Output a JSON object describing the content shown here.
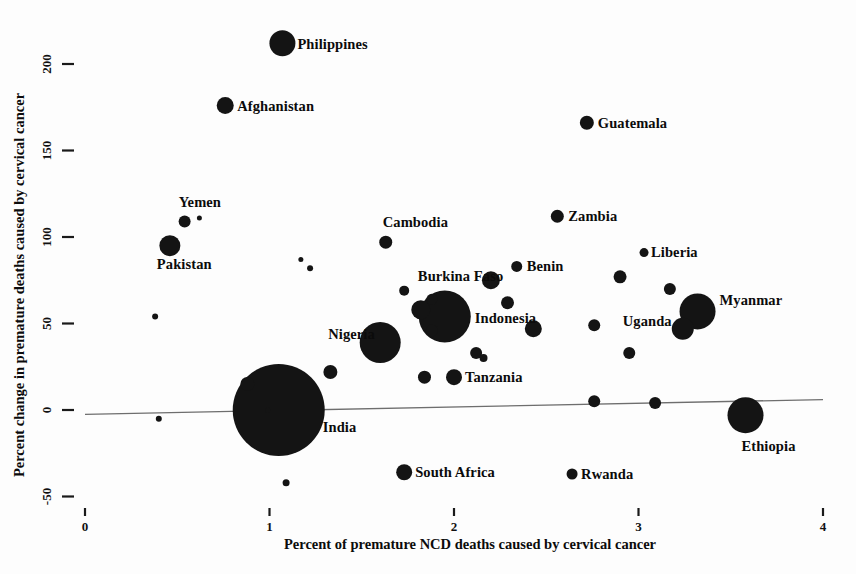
{
  "chart_data": {
    "type": "scatter",
    "title": "",
    "xlabel": "Percent of premature NCD deaths caused by cervical cancer",
    "ylabel": "Percent change in premature deaths caused by cervical cancer",
    "xlim": [
      0,
      4
    ],
    "ylim": [
      -50,
      220
    ],
    "xticks": [
      0,
      1,
      2,
      3,
      4
    ],
    "xticklabels": [
      "0",
      "1",
      "2",
      "3",
      "4"
    ],
    "yticks": [
      -50,
      0,
      50,
      100,
      150,
      200
    ],
    "yticklabels": [
      "-50",
      "0",
      "50",
      "100",
      "150",
      "200"
    ],
    "grid": false,
    "legend": null,
    "size_encoding": "bubble area proportional to number of premature deaths from cervical cancer",
    "fit_line": {
      "visible": true,
      "x_start": 0.0,
      "x_end": 4.0,
      "y_start": -2.5,
      "y_end": 6.0
    },
    "points": [
      {
        "label": "Philippines",
        "x": 1.07,
        "y": 212,
        "r": 13.0,
        "label_dx": 15,
        "label_dy": 6
      },
      {
        "label": "Afghanistan",
        "x": 0.76,
        "y": 176,
        "r": 8.5,
        "label_dx": 12,
        "label_dy": 5
      },
      {
        "label": "Guatemala",
        "x": 2.72,
        "y": 166,
        "r": 7.0,
        "label_dx": 11,
        "label_dy": 5
      },
      {
        "label": "Yemen",
        "x": 0.54,
        "y": 109,
        "r": 6.0,
        "label_dx": -6,
        "label_dy": -14
      },
      {
        "label": "Zambia",
        "x": 2.56,
        "y": 112,
        "r": 6.5,
        "label_dx": 11,
        "label_dy": 5
      },
      {
        "label": "Pakistan",
        "x": 0.46,
        "y": 95,
        "r": 10.5,
        "label_dx": -13,
        "label_dy": 23
      },
      {
        "label": "Cambodia",
        "x": 1.63,
        "y": 97,
        "r": 6.5,
        "label_dx": -3,
        "label_dy": -15
      },
      {
        "label": "Liberia",
        "x": 3.03,
        "y": 91,
        "r": 4.5,
        "label_dx": 7,
        "label_dy": 4
      },
      {
        "label": "Benin",
        "x": 2.34,
        "y": 83,
        "r": 5.5,
        "label_dx": 10,
        "label_dy": 5
      },
      {
        "label": "Burkina Faso",
        "x": 1.88,
        "y": 64,
        "r": 5.5,
        "label_dx": -14,
        "label_dy": -18
      },
      {
        "label": "Myanmar",
        "x": 3.32,
        "y": 57,
        "r": 18.0,
        "label_dx": 22,
        "label_dy": -6
      },
      {
        "label": "Indonesia",
        "x": 1.95,
        "y": 54,
        "r": 26.0,
        "label_dx": 30,
        "label_dy": 6
      },
      {
        "label": "Uganda",
        "x": 3.24,
        "y": 47,
        "r": 11.0,
        "label_dx": -60,
        "label_dy": -3
      },
      {
        "label": "Nigeria",
        "x": 1.6,
        "y": 39,
        "r": 20.5,
        "label_dx": -52,
        "label_dy": -4
      },
      {
        "label": "Tanzania",
        "x": 2.0,
        "y": 19,
        "r": 8.0,
        "label_dx": 11,
        "label_dy": 5
      },
      {
        "label": "India",
        "x": 1.05,
        "y": 0,
        "r": 46.0,
        "label_dx": 44,
        "label_dy": 22
      },
      {
        "label": "Ethiopia",
        "x": 3.58,
        "y": -3,
        "r": 18.0,
        "label_dx": -4,
        "label_dy": 36
      },
      {
        "label": "South Africa",
        "x": 1.73,
        "y": -36,
        "r": 8.0,
        "label_dx": 11,
        "label_dy": 5
      },
      {
        "label": "Rwanda",
        "x": 2.64,
        "y": -37,
        "r": 5.5,
        "label_dx": 9,
        "label_dy": 5
      },
      {
        "label": "",
        "x": 0.62,
        "y": 111,
        "r": 2.5,
        "label_dx": 0,
        "label_dy": 0
      },
      {
        "label": "",
        "x": 1.17,
        "y": 87,
        "r": 2.5,
        "label_dx": 0,
        "label_dy": 0
      },
      {
        "label": "",
        "x": 1.22,
        "y": 82,
        "r": 3.0,
        "label_dx": 0,
        "label_dy": 0
      },
      {
        "label": "",
        "x": 0.38,
        "y": 54,
        "r": 3.0,
        "label_dx": 0,
        "label_dy": 0
      },
      {
        "label": "",
        "x": 1.73,
        "y": 69,
        "r": 5.0,
        "label_dx": 0,
        "label_dy": 0
      },
      {
        "label": "",
        "x": 1.82,
        "y": 58,
        "r": 9.5,
        "label_dx": 0,
        "label_dy": 0
      },
      {
        "label": "",
        "x": 1.88,
        "y": 46,
        "r": 6.0,
        "label_dx": 0,
        "label_dy": 0
      },
      {
        "label": "",
        "x": 2.2,
        "y": 75,
        "r": 9.0,
        "label_dx": 0,
        "label_dy": 0
      },
      {
        "label": "",
        "x": 2.29,
        "y": 62,
        "r": 6.5,
        "label_dx": 0,
        "label_dy": 0
      },
      {
        "label": "",
        "x": 2.43,
        "y": 47,
        "r": 8.5,
        "label_dx": 0,
        "label_dy": 0
      },
      {
        "label": "",
        "x": 2.12,
        "y": 33,
        "r": 6.0,
        "label_dx": 0,
        "label_dy": 0
      },
      {
        "label": "",
        "x": 2.16,
        "y": 30,
        "r": 4.0,
        "label_dx": 0,
        "label_dy": 0
      },
      {
        "label": "",
        "x": 2.9,
        "y": 77,
        "r": 6.5,
        "label_dx": 0,
        "label_dy": 0
      },
      {
        "label": "",
        "x": 3.17,
        "y": 70,
        "r": 6.0,
        "label_dx": 0,
        "label_dy": 0
      },
      {
        "label": "",
        "x": 2.76,
        "y": 49,
        "r": 6.0,
        "label_dx": 0,
        "label_dy": 0
      },
      {
        "label": "",
        "x": 2.95,
        "y": 33,
        "r": 6.0,
        "label_dx": 0,
        "label_dy": 0
      },
      {
        "label": "",
        "x": 1.84,
        "y": 19,
        "r": 6.5,
        "label_dx": 0,
        "label_dy": 0
      },
      {
        "label": "",
        "x": 2.76,
        "y": 5,
        "r": 6.0,
        "label_dx": 0,
        "label_dy": 0
      },
      {
        "label": "",
        "x": 3.09,
        "y": 4,
        "r": 6.0,
        "label_dx": 0,
        "label_dy": 0
      },
      {
        "label": "",
        "x": 1.33,
        "y": 22,
        "r": 7.0,
        "label_dx": 0,
        "label_dy": 0
      },
      {
        "label": "",
        "x": 0.88,
        "y": 15,
        "r": 7.0,
        "label_dx": 0,
        "label_dy": 0
      },
      {
        "label": "",
        "x": 0.99,
        "y": 0,
        "r": 2.5,
        "label_dx": 0,
        "label_dy": 0
      },
      {
        "label": "",
        "x": 0.4,
        "y": -5,
        "r": 3.0,
        "label_dx": 0,
        "label_dy": 0
      },
      {
        "label": "",
        "x": 1.09,
        "y": -42,
        "r": 3.5,
        "label_dx": 0,
        "label_dy": 0
      }
    ]
  },
  "axes": {
    "x_title": "Percent of premature NCD deaths caused by cervical cancer",
    "y_title": "Percent change in premature deaths caused by cervical cancer"
  }
}
